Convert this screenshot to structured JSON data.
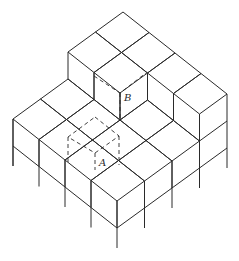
{
  "figure": {
    "labels": {
      "A": "A",
      "B": "B"
    },
    "grid": {
      "origin": [
        123,
        66
      ],
      "r": [
        26,
        20.5
      ],
      "l": [
        -27.5,
        20
      ],
      "h": 27,
      "base": {
        "i": 4,
        "j": 4,
        "height": 1
      },
      "raised": [
        {
          "i0": 0,
          "i1": 2,
          "j0": 0,
          "j1": 2,
          "height": 2
        },
        {
          "i0": 2,
          "i1": 4,
          "j0": 0,
          "j1": 1,
          "height": 2
        }
      ],
      "leg_extension": 20
    },
    "line_color": "#2a2a2a",
    "background": "#ffffff"
  }
}
